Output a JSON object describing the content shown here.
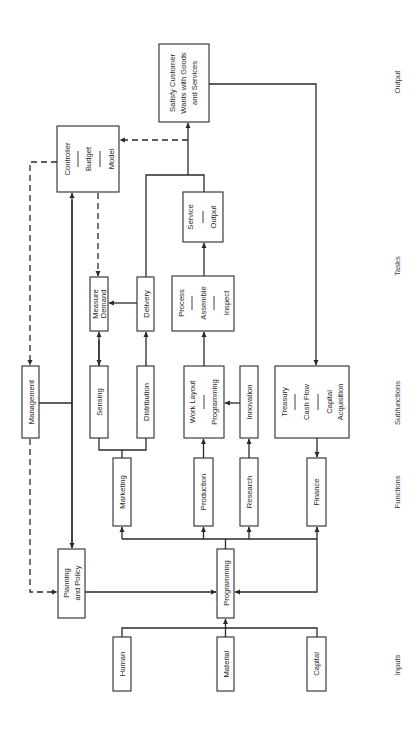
{
  "diagram": {
    "columns": {
      "inputs": "Inputs",
      "functions": "Functions",
      "subfunctions": "Subfunctions",
      "tasks": "Tasks",
      "output": "Output"
    },
    "inputs": [
      "Human",
      "Material",
      "Capital"
    ],
    "core": {
      "programming": "Programming",
      "planning_line1": "Planning",
      "planning_line2": "and Policy",
      "management": "Management",
      "controller": [
        "Controller",
        "Budget",
        "Model"
      ]
    },
    "functions": [
      "Marketing",
      "Production",
      "Research",
      "Finance"
    ],
    "subfunctions": {
      "sensing": "Sensing",
      "distribution": "Distribution",
      "work_layout": [
        "Work Layout",
        "Programming"
      ],
      "innovation": "Innovation",
      "treasury": [
        "Treasury",
        "Cash Flow",
        "Capital",
        "Acquisition"
      ]
    },
    "tasks": {
      "measure_demand": [
        "Measure",
        "Demand"
      ],
      "delivery": "Delivery",
      "process": [
        "Process",
        "Assemble",
        "Inspect"
      ],
      "service": [
        "Service",
        "Output"
      ]
    },
    "output": [
      "Satisfy Customer",
      "Wants with Goods",
      "and Services"
    ]
  }
}
